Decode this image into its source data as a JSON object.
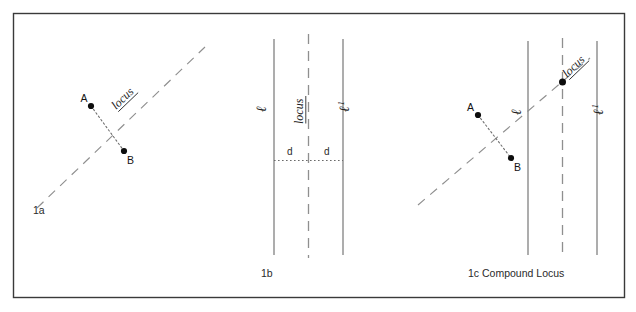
{
  "figure": {
    "frame": {
      "stroke_color": "#3a3a3a",
      "background": "#ffffff"
    },
    "panels": [
      {
        "id": "panel-1a",
        "caption": "1a",
        "locus_label": "locus",
        "points": [
          {
            "name": "A",
            "label": "A"
          },
          {
            "name": "B",
            "label": "B"
          }
        ],
        "description_labels": {
          "segment": "AB",
          "locus_type": "perpendicular-bisector"
        }
      },
      {
        "id": "panel-1b",
        "caption": "1b",
        "locus_label": "locus",
        "line_labels": [
          {
            "base": "ℓ",
            "sup": ""
          },
          {
            "base": "ℓ",
            "sup": "1"
          }
        ],
        "distance_labels": [
          "d",
          "d"
        ]
      },
      {
        "id": "panel-1c",
        "caption": "1c Compound Locus",
        "locus_label_diagonal": "locus",
        "line_labels": [
          {
            "base": "ℓ",
            "sup": ""
          },
          {
            "base": "ℓ",
            "sup": "1"
          }
        ],
        "points": [
          {
            "name": "A",
            "label": "A"
          },
          {
            "name": "B",
            "label": "B"
          }
        ]
      }
    ],
    "colors": {
      "frame": "#3a3a3a",
      "dashed_line": "#8a8a8a",
      "solid_line": "#707070",
      "dotted_line": "#6a6a6a",
      "point_fill": "#0d0d0d",
      "text": "#1b1b1b"
    }
  }
}
